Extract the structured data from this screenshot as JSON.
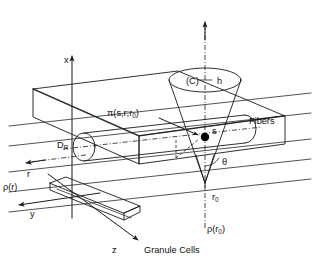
{
  "figure": {
    "background_color": "#ffffff",
    "line_color": "#1a1a1a"
  },
  "axes": [
    {
      "id": "x",
      "label": "x",
      "direction": "up"
    },
    {
      "id": "y",
      "label": "y",
      "direction": "left"
    },
    {
      "id": "z",
      "label": "z",
      "direction": "down-right"
    },
    {
      "id": "r",
      "label": "r",
      "direction": "left",
      "style": "dash-dot"
    }
  ],
  "labels": {
    "x_axis": "x",
    "y_axis": "y",
    "z_axis": "z",
    "r_axis": "r",
    "rho_r": "ρ(r)",
    "rho_r0_prefix": "ρ(r",
    "rho_r0_sub": "0",
    "rho_r0_suffix": ")",
    "d_r_prefix": "D",
    "d_r_sub": "R",
    "cone_set": "(C)",
    "cone_height": "h",
    "cone_angle": "θ",
    "point_s": "s",
    "r_zero_prefix": "r",
    "r_zero_sub": "0",
    "pi_prefix": "π(s,r;r",
    "pi_sub": "0",
    "pi_suffix": ")",
    "fibers": "Fibers",
    "granule_cells": "Granule Cells"
  },
  "elements": {
    "slab": "molecular-layer-slab",
    "cylinder": "fiber-bundle-cylinder",
    "cone": "influence-cone",
    "granule_slab": "granule-cell-layer-slab",
    "point": "point-s-marker"
  }
}
